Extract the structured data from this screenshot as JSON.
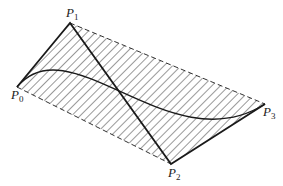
{
  "diagram": {
    "type": "bezier-control-polygon",
    "points": [
      {
        "name": "P0",
        "label": "P",
        "sub": "0",
        "x": 17,
        "y": 87
      },
      {
        "name": "P1",
        "label": "P",
        "sub": "1",
        "x": 70,
        "y": 23
      },
      {
        "name": "P2",
        "label": "P",
        "sub": "2",
        "x": 171,
        "y": 164
      },
      {
        "name": "P3",
        "label": "P",
        "sub": "3",
        "x": 265,
        "y": 104
      }
    ],
    "colors": {
      "stroke": "#1a1a1a",
      "hatch": "#333333",
      "background": "#ffffff"
    }
  }
}
